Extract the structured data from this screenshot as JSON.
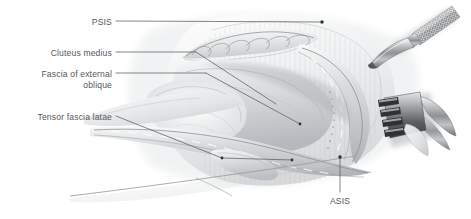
{
  "figure": {
    "type": "anatomical-surgical-illustration",
    "width": 471,
    "height": 219,
    "background_color": "#ffffff",
    "label_color": "#55585b",
    "leader_line_color": "#5b5e61"
  },
  "labels": [
    {
      "id": "psis",
      "text": "PSIS",
      "x": 82,
      "y": 17,
      "align": "right",
      "width": 30,
      "leader": {
        "x1": 116,
        "y1": 21,
        "x2": 322,
        "y2": 22,
        "dot": true
      }
    },
    {
      "id": "gluteus-medius",
      "text": "Cluteus medius",
      "x": 36,
      "y": 48,
      "align": "right",
      "width": 76,
      "leader": {
        "x1": 116,
        "y1": 52,
        "x2": 196,
        "y2": 52,
        "dot": false
      }
    },
    {
      "id": "fascia-external-oblique",
      "text": "Fascia of external\noblique",
      "x": 24,
      "y": 69,
      "align": "right",
      "width": 88,
      "leader": {
        "x1": 116,
        "y1": 73,
        "x2": 206,
        "y2": 73,
        "dot": false
      }
    },
    {
      "id": "tensor-fascia-latae",
      "text": "Tensor fascia latae",
      "x": 21,
      "y": 112,
      "align": "right",
      "width": 91,
      "leader": {
        "x1": 116,
        "y1": 116,
        "x2": 222,
        "y2": 158,
        "dot": true
      }
    },
    {
      "id": "asis",
      "text": "ASIS",
      "x": 325,
      "y": 196,
      "align": "center",
      "width": 30,
      "leader": {
        "x1": 340,
        "y1": 194,
        "x2": 340,
        "y2": 157,
        "dot": true
      }
    }
  ],
  "instruments": [
    {
      "id": "scalpel",
      "name": "scalpel-with-knurled-handle",
      "position": "upper-right"
    },
    {
      "id": "rake-retractor",
      "name": "four-prong-rake-retractor",
      "position": "right"
    }
  ],
  "anatomy": [
    {
      "id": "iliac-crest",
      "name": "iliac-crest-bone"
    },
    {
      "id": "gluteus-medius-muscle",
      "name": "gluteus-medius-muscle-belly"
    },
    {
      "id": "external-oblique-fascia",
      "name": "external-oblique-fascia-sheet"
    },
    {
      "id": "tensor-fascia-latae-muscle",
      "name": "tensor-fascia-latae-muscle"
    },
    {
      "id": "skin-flap",
      "name": "retracted-skin-flap"
    }
  ]
}
